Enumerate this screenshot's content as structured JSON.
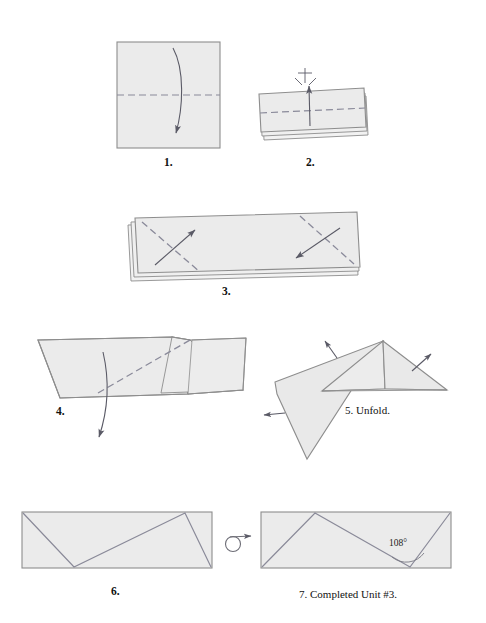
{
  "document": {
    "title": "Origami Unit #3 folding instructions",
    "background_color": "#ffffff"
  },
  "style": {
    "paper_fill": "#ebebeb",
    "paper_fill_light": "#f1f1f1",
    "paper_edge": "#8d8d8d",
    "crease_line": "#8a8a99",
    "dashed_fold": "#8a8a9a",
    "arrow_color": "#5a5a66",
    "text_color": "#111111"
  },
  "steps": [
    {
      "id": "step-1",
      "number": "1.",
      "caption": "1.",
      "label_text": "",
      "shape": "square",
      "fold_lines": [
        "horizontal-midline-dashed"
      ],
      "arrows": [
        "curved-arrow-down"
      ]
    },
    {
      "id": "step-2",
      "number": "2.",
      "caption": "2.",
      "label_text": "",
      "shape": "folded-rectangle-two-layers",
      "fold_lines": [
        "horizontal-midline-dashed"
      ],
      "arrows": [
        "straight-arrow-up",
        "pinch-crease-mark"
      ]
    },
    {
      "id": "step-3",
      "number": "3.",
      "caption": "3.",
      "label_text": "",
      "shape": "stacked-rectangle-three-layers",
      "fold_lines": [
        "diagonal-dashed-left",
        "diagonal-dashed-right"
      ],
      "arrows": [
        "arrow-up-right",
        "arrow-down-left"
      ]
    },
    {
      "id": "step-4",
      "number": "4.",
      "caption": "4.",
      "label_text": "",
      "shape": "zigzag-parallelogram",
      "fold_lines": [
        "diagonal-dashed"
      ],
      "arrows": [
        "curved-arrow-down"
      ]
    },
    {
      "id": "step-5",
      "number": "5.",
      "caption": "5. Unfold.",
      "label_text": "Unfold.",
      "shape": "opened-triangular-form",
      "fold_lines": [],
      "arrows": [
        "arrow-up-left",
        "arrow-up-right",
        "arrow-left"
      ]
    },
    {
      "id": "step-6",
      "number": "6.",
      "caption": "6.",
      "label_text": "",
      "shape": "rectangle-with-zigzag-creases",
      "fold_lines": [
        "zigzag-creases"
      ],
      "arrows": []
    },
    {
      "id": "step-7",
      "number": "7.",
      "caption": "7. Completed Unit #3.",
      "label_text": "Completed Unit #3.",
      "shape": "rectangle-with-zigzag-creases-mirrored",
      "fold_lines": [
        "zigzag-creases"
      ],
      "arrows": [],
      "annotation": {
        "angle_value": "108°",
        "angle_name": "interior-crease-angle"
      }
    }
  ],
  "symbols": {
    "turn_over": {
      "name": "turn-over-symbol",
      "description": "circle with arrow indicating flip the model over",
      "between_steps": "6-7"
    }
  }
}
